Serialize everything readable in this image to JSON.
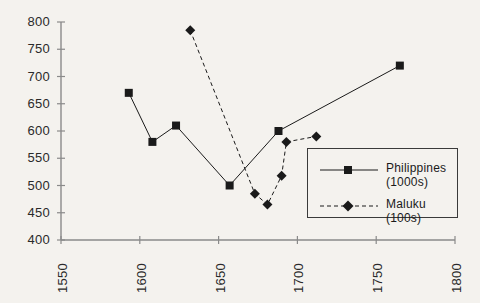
{
  "chart_data": {
    "type": "line",
    "title": "",
    "xlabel": "",
    "ylabel": "",
    "xlim": [
      1550,
      1800
    ],
    "ylim": [
      400,
      800
    ],
    "grid": false,
    "legend_position": "right-inside",
    "xticks": [
      1550,
      1600,
      1650,
      1700,
      1750,
      1800
    ],
    "yticks": [
      400,
      450,
      500,
      550,
      600,
      650,
      700,
      750,
      800
    ],
    "series": [
      {
        "name": "Philippines (1000s)",
        "style": "solid",
        "marker": "square",
        "color": "#1a1a1a",
        "points": [
          {
            "x": 1593,
            "y": 670
          },
          {
            "x": 1608,
            "y": 580
          },
          {
            "x": 1623,
            "y": 610
          },
          {
            "x": 1657,
            "y": 500
          },
          {
            "x": 1688,
            "y": 600
          },
          {
            "x": 1765,
            "y": 720
          }
        ]
      },
      {
        "name": "Maluku (100s)",
        "style": "dashed",
        "marker": "diamond",
        "color": "#1a1a1a",
        "points": [
          {
            "x": 1632,
            "y": 785
          },
          {
            "x": 1673,
            "y": 485
          },
          {
            "x": 1681,
            "y": 465
          },
          {
            "x": 1690,
            "y": 518
          },
          {
            "x": 1693,
            "y": 580
          },
          {
            "x": 1712,
            "y": 590
          }
        ]
      }
    ]
  },
  "legend": {
    "entries": [
      {
        "label_line1": "Philippines",
        "label_line2": "(1000s)"
      },
      {
        "label_line1": "Maluku (100s)",
        "label_line2": ""
      }
    ]
  },
  "colors": {
    "background": "#f4f2ee",
    "axis": "#8a8a8a",
    "ink": "#1a1a1a",
    "legend_border": "#3a3a3a"
  }
}
